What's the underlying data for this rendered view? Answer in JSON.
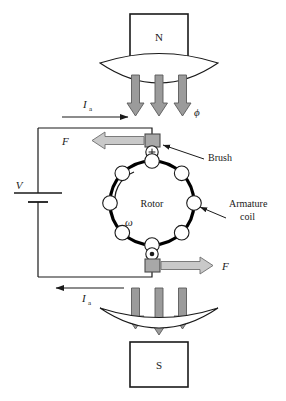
{
  "figure": {
    "background_color": "#ffffff"
  },
  "colors": {
    "line": "#1a1a1a",
    "flux_arrow_fill": "#9b9b9b",
    "flux_arrow_stroke": "#5a5a5a",
    "force_arrow_fill": "#c9c9c9",
    "force_arrow_stroke": "#6e6e6e",
    "brush_fill": "#a8a8a8",
    "brush_stroke": "#4a4a4a",
    "rotor_stroke": "#000000",
    "coil_stroke": "#1a1a1a"
  },
  "poles": {
    "north": {
      "label": "N",
      "name": "north-pole-magnet"
    },
    "south": {
      "label": "S",
      "name": "south-pole-magnet"
    }
  },
  "flux": {
    "symbol": "ϕ",
    "arrow_count_top": 3,
    "arrow_count_bottom": 3,
    "direction": "downward"
  },
  "rotor": {
    "label": "Rotor",
    "omega_symbol": "ω",
    "rotation": "counterclockwise",
    "coil_count": 8
  },
  "labels": {
    "brush": "Brush",
    "armature_coil_line1": "Armature",
    "armature_coil_line2": "coil",
    "voltage": "V",
    "current_top": "I",
    "current_top_sub": "a",
    "current_bottom": "I",
    "current_bottom_sub": "a",
    "force_top": "F",
    "force_bottom": "F"
  },
  "commutator": {
    "top_marker": "+",
    "top_meaning": "current-into-page",
    "bottom_marker": "•",
    "bottom_meaning": "current-out-of-page"
  },
  "circuit": {
    "source_type": "dc-voltage-source",
    "current_top_direction": "right",
    "current_bottom_direction": "left"
  }
}
